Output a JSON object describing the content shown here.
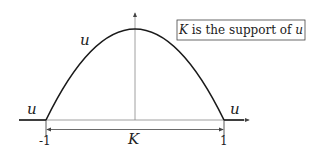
{
  "diagram": {
    "function_label": "u",
    "curve_label": "u",
    "left_label": "u",
    "right_label": "u",
    "support_label": "K",
    "x_ticks": [
      "-1",
      "1"
    ],
    "caption": {
      "math_symbol": "K",
      "text": " is the support of ",
      "math_var": "u"
    },
    "colors": {
      "curve": "#1a1a1a",
      "axis": "#555555",
      "box_border": "#444444"
    }
  }
}
